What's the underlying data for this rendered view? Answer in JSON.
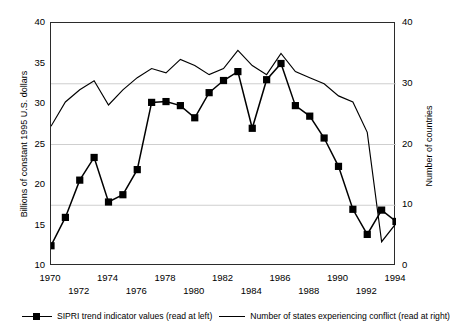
{
  "chart_data": {
    "type": "line",
    "title": "",
    "subtitle": "",
    "xlabel": "",
    "ylabel": "Billions of constant 1995 U.S. dollars",
    "y2label": "Number of countries",
    "x": [
      1970,
      1971,
      1972,
      1973,
      1974,
      1975,
      1976,
      1977,
      1978,
      1979,
      1980,
      1981,
      1982,
      1983,
      1984,
      1985,
      1986,
      1987,
      1988,
      1989,
      1990,
      1991,
      1992,
      1993,
      1994
    ],
    "xlim": [
      1970,
      1994
    ],
    "xtick_labels": [
      "1970",
      "1971",
      "1972",
      "1973",
      "1974",
      "1975",
      "1976",
      "1977",
      "1978",
      "1979",
      "1980",
      "1981",
      "1982",
      "1983",
      "1984",
      "1985",
      "1986",
      "1987",
      "1988",
      "1989",
      "1990",
      "1991",
      "1992",
      "1993",
      "1994"
    ],
    "xticks_shown": [
      "1970",
      "1972",
      "1974",
      "1976",
      "1978",
      "1980",
      "1982",
      "1984",
      "1986",
      "1988",
      "1990",
      "1992",
      "1994"
    ],
    "xticks_row_top": [
      "1970",
      "1974",
      "1978",
      "1982",
      "1986",
      "1990",
      "1994"
    ],
    "xticks_row_bottom": [
      "1972",
      "1976",
      "1980",
      "1984",
      "1988",
      "1992"
    ],
    "ylim": [
      10,
      40
    ],
    "yticks": [
      10,
      15,
      20,
      25,
      30,
      35,
      40
    ],
    "y2lim": [
      0,
      40
    ],
    "y2ticks": [
      0,
      10,
      20,
      30,
      40
    ],
    "grid": "horizontal",
    "legend_position": "below",
    "series": [
      {
        "name": "SIPRI trend indicator values (read at left)",
        "axis": "left",
        "marker": "filled-square",
        "color": "#000000",
        "values": [
          12.5,
          16.0,
          20.6,
          23.4,
          17.9,
          18.8,
          21.9,
          30.2,
          30.3,
          29.8,
          28.3,
          31.4,
          32.9,
          34.0,
          27.0,
          33.0,
          35.0,
          29.8,
          28.5,
          25.8,
          22.3,
          17.0,
          13.9,
          16.9,
          15.5
        ]
      },
      {
        "name": "Number of states experiencing conflict (read at right)",
        "axis": "right",
        "marker": "none",
        "color": "#000000",
        "values": [
          23,
          27,
          29,
          30.5,
          26.5,
          29,
          31,
          32.5,
          31.8,
          34,
          33,
          31.5,
          32.5,
          35.5,
          33,
          31.5,
          35,
          32,
          31,
          30,
          28,
          27,
          22,
          4,
          7
        ]
      }
    ]
  },
  "legend": {
    "items": [
      {
        "label": "SIPRI trend indicator values (read at left)"
      },
      {
        "label": "Number of states experiencing conflict (read at right)"
      }
    ]
  }
}
